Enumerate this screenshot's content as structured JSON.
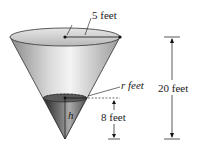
{
  "diagram": {
    "type": "conical tank with water",
    "labels": {
      "top_radius": "5 feet",
      "water_radius": "r feet",
      "water_height_var": "h",
      "water_height": "8 feet",
      "total_height": "20 feet"
    }
  }
}
